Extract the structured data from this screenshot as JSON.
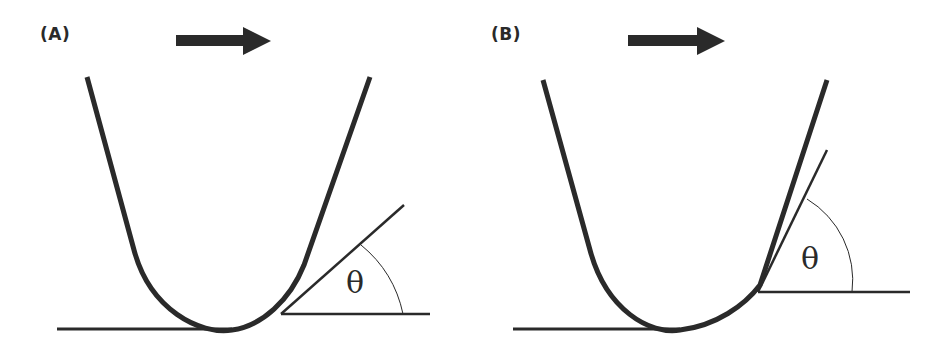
{
  "figure": {
    "colors": {
      "stroke": "#2a2a2a",
      "background": "#ffffff"
    },
    "panels": [
      {
        "id": "A",
        "label": "(A)",
        "motion_direction": "right",
        "angle_symbol": "θ",
        "tangent_angle_deg": 40
      },
      {
        "id": "B",
        "label": "(B)",
        "motion_direction": "right",
        "angle_symbol": "θ",
        "tangent_angle_deg": 64
      }
    ]
  }
}
